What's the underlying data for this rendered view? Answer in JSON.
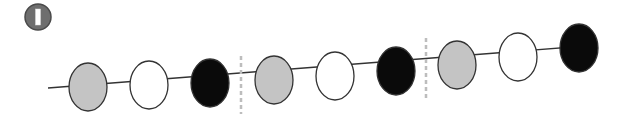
{
  "badge": {
    "label": "I",
    "color": "#6e6e6e",
    "cx": 38,
    "cy": 17,
    "r": 13
  },
  "colors": {
    "gray": "#c4c4c4",
    "white": "#ffffff",
    "black": "#0a0a0a",
    "stroke": "#333333",
    "divider": "#bdbdbd"
  },
  "axis_line": {
    "x1": 48,
    "y1": 88,
    "x2": 598,
    "y2": 45
  },
  "groups": [
    {
      "circles": [
        {
          "fill": "gray",
          "cx": 88,
          "cy": 87,
          "rx": 19,
          "ry": 24
        },
        {
          "fill": "white",
          "cx": 149,
          "cy": 85,
          "rx": 19,
          "ry": 24
        },
        {
          "fill": "black",
          "cx": 210,
          "cy": 83,
          "rx": 19,
          "ry": 24
        }
      ]
    },
    {
      "circles": [
        {
          "fill": "gray",
          "cx": 274,
          "cy": 80,
          "rx": 19,
          "ry": 24
        },
        {
          "fill": "white",
          "cx": 335,
          "cy": 76,
          "rx": 19,
          "ry": 24
        },
        {
          "fill": "black",
          "cx": 396,
          "cy": 71,
          "rx": 19,
          "ry": 24
        }
      ]
    },
    {
      "circles": [
        {
          "fill": "gray",
          "cx": 457,
          "cy": 65,
          "rx": 19,
          "ry": 24
        },
        {
          "fill": "white",
          "cx": 518,
          "cy": 57,
          "rx": 19,
          "ry": 24
        },
        {
          "fill": "black",
          "cx": 579,
          "cy": 48,
          "rx": 19,
          "ry": 24
        }
      ]
    }
  ],
  "dividers": [
    {
      "x": 241,
      "y1": 56,
      "y2": 114
    },
    {
      "x": 426,
      "y1": 38,
      "y2": 98
    }
  ]
}
